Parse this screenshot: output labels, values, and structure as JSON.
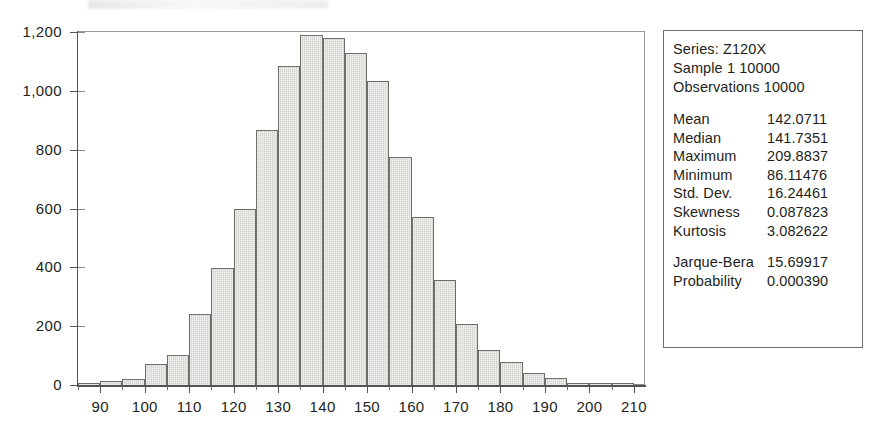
{
  "chart_data": {
    "type": "bar",
    "title": "",
    "xlabel": "",
    "ylabel": "",
    "grid": false,
    "legend_position": "right",
    "xlim": [
      85,
      212.5
    ],
    "ylim": [
      0,
      1200
    ],
    "bin_width": 5,
    "x_ticks": [
      "90",
      "100",
      "110",
      "120",
      "130",
      "140",
      "150",
      "160",
      "170",
      "180",
      "190",
      "200",
      "210"
    ],
    "x_tick_values": [
      90,
      100,
      110,
      120,
      130,
      140,
      150,
      160,
      170,
      180,
      190,
      200,
      210
    ],
    "y_ticks": [
      "0",
      "200",
      "400",
      "600",
      "800",
      "1,000",
      "1,200"
    ],
    "y_tick_values": [
      0,
      200,
      400,
      600,
      800,
      1000,
      1200
    ],
    "bin_starts": [
      85,
      90,
      95,
      100,
      105,
      110,
      115,
      120,
      125,
      130,
      135,
      140,
      145,
      150,
      155,
      160,
      165,
      170,
      175,
      180,
      185,
      190,
      195,
      200,
      205
    ],
    "bin_centers": [
      87.5,
      92.5,
      97.5,
      102.5,
      107.5,
      112.5,
      117.5,
      122.5,
      127.5,
      132.5,
      137.5,
      142.5,
      147.5,
      152.5,
      157.5,
      162.5,
      167.5,
      172.5,
      177.5,
      182.5,
      187.5,
      192.5,
      197.5,
      202.5,
      207.5
    ],
    "values": [
      5,
      12,
      22,
      70,
      103,
      240,
      398,
      600,
      866,
      1085,
      1190,
      1180,
      1130,
      1032,
      775,
      570,
      358,
      208,
      120,
      78,
      42,
      25,
      8,
      3,
      2
    ],
    "colors": {
      "bar_fill": "#d3d3ce",
      "bar_border": "#6f6d69",
      "axis": "#55534f",
      "text": "#231f20",
      "panel_border": "#6f6d69",
      "background": "#ffffff"
    }
  },
  "stats_panel": {
    "series_line": "Series: Z120X",
    "sample_line": "Sample 1 10000",
    "observations_line": "Observations 10000",
    "rows": [
      {
        "label": "Mean",
        "value": "142.0711"
      },
      {
        "label": "Median",
        "value": "141.7351"
      },
      {
        "label": "Maximum",
        "value": "209.8837"
      },
      {
        "label": "Minimum",
        "value": "86.11476"
      },
      {
        "label": "Std. Dev.",
        "value": "16.24461"
      },
      {
        "label": "Skewness",
        "value": "0.087823"
      },
      {
        "label": "Kurtosis",
        "value": "3.082622"
      }
    ],
    "test_rows": [
      {
        "label": "Jarque-Bera",
        "value": "15.69917"
      },
      {
        "label": "Probability",
        "value": "0.000390"
      }
    ]
  }
}
